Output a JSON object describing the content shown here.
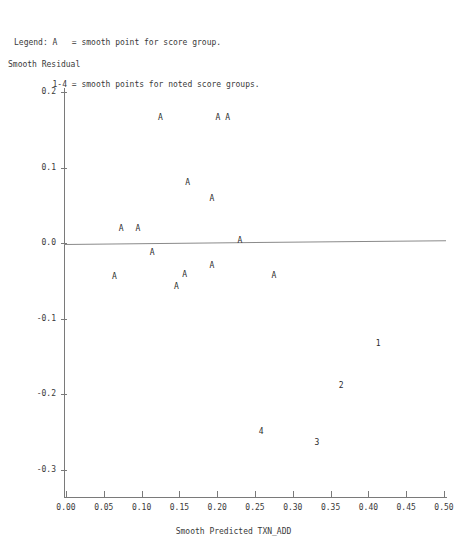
{
  "legend": {
    "lines": [
      "Legend: A   = smooth point for score group.",
      "        1-4 = smooth points for noted score groups."
    ]
  },
  "chart_data": {
    "type": "scatter",
    "title": "",
    "xlabel": "Smooth Predicted TXN_ADD",
    "ylabel": "Smooth Residual",
    "xlim": [
      0.0,
      0.5
    ],
    "ylim": [
      -0.3,
      0.2
    ],
    "xticks": [
      "0.00",
      "0.05",
      "0.10",
      "0.15",
      "0.20",
      "0.25",
      "0.30",
      "0.35",
      "0.40",
      "0.45",
      "0.50"
    ],
    "xtick_values": [
      0.0,
      0.05,
      0.1,
      0.15,
      0.2,
      0.25,
      0.3,
      0.35,
      0.4,
      0.45,
      0.5
    ],
    "yticks": [
      "0.2",
      "0.1",
      "0.0",
      "-0.1",
      "-0.2",
      "-0.3"
    ],
    "ytick_values": [
      0.2,
      0.1,
      0.0,
      -0.1,
      -0.2,
      -0.3
    ],
    "grid": false,
    "legend_position": "above-plot",
    "reference_line": {
      "label": "zero residual reference line",
      "y_at_xmin": -0.001,
      "y_at_xmax": 0.004
    },
    "points": [
      {
        "label": "A",
        "x": 0.125,
        "y": 0.165
      },
      {
        "label": "A",
        "x": 0.201,
        "y": 0.165
      },
      {
        "label": "A",
        "x": 0.214,
        "y": 0.165
      },
      {
        "label": "A",
        "x": 0.161,
        "y": 0.079
      },
      {
        "label": "A",
        "x": 0.193,
        "y": 0.058
      },
      {
        "label": "A",
        "x": 0.073,
        "y": 0.018
      },
      {
        "label": "A",
        "x": 0.095,
        "y": 0.018
      },
      {
        "label": "A",
        "x": 0.23,
        "y": 0.003
      },
      {
        "label": "A",
        "x": 0.114,
        "y": -0.013
      },
      {
        "label": "A",
        "x": 0.064,
        "y": -0.045
      },
      {
        "label": "A",
        "x": 0.157,
        "y": -0.042
      },
      {
        "label": "A",
        "x": 0.146,
        "y": -0.058
      },
      {
        "label": "A",
        "x": 0.193,
        "y": -0.03
      },
      {
        "label": "A",
        "x": 0.275,
        "y": -0.044
      },
      {
        "label": "1",
        "x": 0.413,
        "y": -0.134
      },
      {
        "label": "2",
        "x": 0.364,
        "y": -0.189
      },
      {
        "label": "4",
        "x": 0.258,
        "y": -0.25
      },
      {
        "label": "3",
        "x": 0.332,
        "y": -0.265
      }
    ]
  }
}
